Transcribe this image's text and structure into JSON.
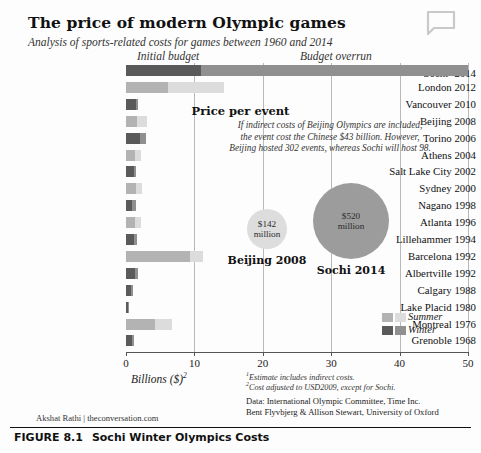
{
  "header": {
    "title": "The price of  modern Olympic games",
    "subtitle": "Analysis of sports-related costs for games between 1960 and 2014",
    "bubble_icon": "speech-bubble-icon"
  },
  "chart_labels": {
    "initial_budget": "Initial budget",
    "budget_overrun": "Budget overrun",
    "axis_title": "Billions ($)",
    "axis_title_sup": "2"
  },
  "callout": {
    "title": "Price per event",
    "body_lines": [
      "If indirect costs of Beijing Olympics are included,",
      "the event cost the Chinese $43 billion. However,",
      "Beijing hosted 302 events, whereas Sochi will host 98."
    ],
    "circles": [
      {
        "value": "$142",
        "unit": "million",
        "label": "Beijing 2008",
        "color": "#dddddd"
      },
      {
        "value": "$520",
        "unit": "million",
        "label": "Sochi 2014",
        "color": "#9c9c9c"
      }
    ]
  },
  "legend": {
    "items": [
      {
        "label": "Summer",
        "initial_color": "#b3b3b3",
        "overrun_color": "#dcdcdc"
      },
      {
        "label": "Winter",
        "initial_color": "#5a5a5a",
        "overrun_color": "#909090"
      }
    ]
  },
  "footnotes": [
    {
      "marker": "1",
      "text": "Estimate includes indirect costs."
    },
    {
      "marker": "2",
      "text": "Cost adjusted to USD2009, except for Sochi."
    }
  ],
  "sources": [
    "Data: International Olympic Committee, Time Inc.",
    "Bent Flyvbjerg & Allison Stewart, University of Oxford"
  ],
  "credit": "Akshat Rathi | theconversation.com",
  "figure": {
    "number": "FIGURE 8.1",
    "caption": "Sochi Winter Olympics Costs"
  },
  "chart_data": {
    "type": "bar",
    "orientation": "horizontal",
    "stacked": true,
    "title": "The price of modern Olympic games",
    "subtitle": "Analysis of sports-related costs for games between 1960 and 2014",
    "xlabel": "Billions ($)",
    "ylabel": "",
    "xlim": [
      0,
      50
    ],
    "xticks": [
      0,
      10,
      20,
      30,
      40,
      50
    ],
    "grid": true,
    "legend_position": "bottom-right",
    "series": [
      {
        "name": "Initial budget",
        "summer_color": "#b3b3b3",
        "winter_color": "#5a5a5a"
      },
      {
        "name": "Budget overrun",
        "summer_color": "#dcdcdc",
        "winter_color": "#909090"
      }
    ],
    "categories": [
      "Sochi 2014",
      "London 2012",
      "Vancouver 2010",
      "Beijing 2008",
      "Torino 2006",
      "Athens 2004",
      "Salt Lake City 2002",
      "Sydney 2000",
      "Nagano 1998",
      "Atlanta 1996",
      "Lillehammer 1994",
      "Barcelona 1992",
      "Albertville 1992",
      "Calgary 1988",
      "Lake Placid 1980",
      "Montreal 1976",
      "Grenoble 1968"
    ],
    "rows": [
      {
        "label": "Sochi",
        "label_sup": "1",
        "year": "2014",
        "season": "winter",
        "initial": 11.0,
        "overrun": 39.0,
        "total": 50.0
      },
      {
        "label": "London",
        "label_sup": "",
        "year": "2012",
        "season": "summer",
        "initial": 6.2,
        "overrun": 8.1,
        "total": 14.3
      },
      {
        "label": "Vancouver",
        "label_sup": "",
        "year": "2010",
        "season": "winter",
        "initial": 1.4,
        "overrun": 0.3,
        "total": 1.7
      },
      {
        "label": "Beijing",
        "label_sup": "",
        "year": "2008",
        "season": "summer",
        "initial": 1.6,
        "overrun": 1.5,
        "total": 3.1
      },
      {
        "label": "Torino",
        "label_sup": "",
        "year": "2006",
        "season": "winter",
        "initial": 2.1,
        "overrun": 0.8,
        "total": 2.9
      },
      {
        "label": "Athens",
        "label_sup": "",
        "year": "2004",
        "season": "summer",
        "initial": 1.3,
        "overrun": 0.9,
        "total": 2.2
      },
      {
        "label": "Salt Lake City",
        "label_sup": "",
        "year": "2002",
        "season": "winter",
        "initial": 1.1,
        "overrun": 0.3,
        "total": 1.4
      },
      {
        "label": "Sydney",
        "label_sup": "",
        "year": "2000",
        "season": "summer",
        "initial": 1.4,
        "overrun": 0.9,
        "total": 2.3
      },
      {
        "label": "Nagano",
        "label_sup": "",
        "year": "1998",
        "season": "winter",
        "initial": 0.9,
        "overrun": 0.5,
        "total": 1.4
      },
      {
        "label": "Atlanta",
        "label_sup": "",
        "year": "1996",
        "season": "summer",
        "initial": 1.3,
        "overrun": 0.9,
        "total": 2.2
      },
      {
        "label": "Lillehammer",
        "label_sup": "",
        "year": "1994",
        "season": "winter",
        "initial": 1.2,
        "overrun": 0.4,
        "total": 1.6
      },
      {
        "label": "Barcelona",
        "label_sup": "",
        "year": "1992",
        "season": "summer",
        "initial": 9.4,
        "overrun": 1.9,
        "total": 11.3
      },
      {
        "label": "Albertville",
        "label_sup": "",
        "year": "1992",
        "season": "winter",
        "initial": 1.3,
        "overrun": 0.4,
        "total": 1.7
      },
      {
        "label": "Calgary",
        "label_sup": "",
        "year": "1988",
        "season": "winter",
        "initial": 0.8,
        "overrun": 0.2,
        "total": 1.0
      },
      {
        "label": "Lake Placid",
        "label_sup": "",
        "year": "1980",
        "season": "winter",
        "initial": 0.3,
        "overrun": 0.1,
        "total": 0.4
      },
      {
        "label": "Montreal",
        "label_sup": "",
        "year": "1976",
        "season": "summer",
        "initial": 4.3,
        "overrun": 2.4,
        "total": 6.7
      },
      {
        "label": "Grenoble",
        "label_sup": "",
        "year": "1968",
        "season": "winter",
        "initial": 0.9,
        "overrun": 0.2,
        "total": 1.1
      }
    ]
  }
}
